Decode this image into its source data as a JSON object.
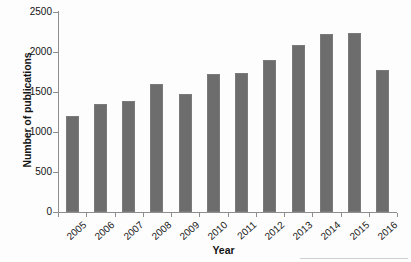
{
  "chart_data": {
    "type": "bar",
    "title": "",
    "xlabel": "Year",
    "ylabel": "Number of publications",
    "categories": [
      "2005",
      "2006",
      "2007",
      "2008",
      "2009",
      "2010",
      "2011",
      "2012",
      "2013",
      "2014",
      "2015",
      "2016"
    ],
    "values": [
      1200,
      1350,
      1390,
      1595,
      1475,
      1730,
      1740,
      1905,
      2085,
      2225,
      2240,
      1780
    ],
    "series": [
      {
        "name": "Number of publications",
        "values": [
          1200,
          1350,
          1390,
          1595,
          1475,
          1730,
          1740,
          1905,
          2085,
          2225,
          2240,
          1780
        ]
      }
    ],
    "ylim": [
      0,
      2500
    ],
    "ytick_values": [
      0,
      500,
      1000,
      1500,
      2000,
      2500
    ],
    "ytick_labels": [
      "0",
      "500",
      "1000",
      "1500",
      "2000",
      "2500"
    ],
    "grid": false,
    "legend": false,
    "legend_position": "none",
    "bar_color": "#6d6d6d",
    "axis_color": "#8e8e8e",
    "background_color": "#fdfdfd"
  }
}
